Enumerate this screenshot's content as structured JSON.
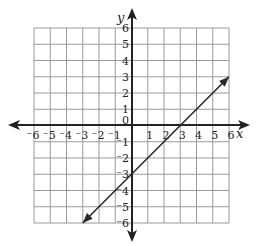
{
  "chart_data": {
    "type": "line",
    "title": "",
    "xlabel": "x",
    "ylabel": "y",
    "xlim": [
      -6,
      6
    ],
    "ylim": [
      -6,
      6
    ],
    "grid": true,
    "x_ticks": [
      "-6",
      "-5",
      "-4",
      "-3",
      "-2",
      "-1",
      "1",
      "2",
      "3",
      "4",
      "5",
      "6"
    ],
    "y_ticks": [
      "6",
      "5",
      "4",
      "3",
      "2",
      "1",
      "0",
      "-1",
      "-2",
      "-3",
      "-4",
      "-5",
      "-6"
    ],
    "origin_label": "0",
    "series": [
      {
        "name": "y = x - 3",
        "x": [
          -3,
          6
        ],
        "y": [
          -6,
          3
        ],
        "arrows_both_ends": true,
        "color": "#2a2a2a"
      }
    ],
    "x_intercept": 3,
    "y_intercept": -3
  }
}
